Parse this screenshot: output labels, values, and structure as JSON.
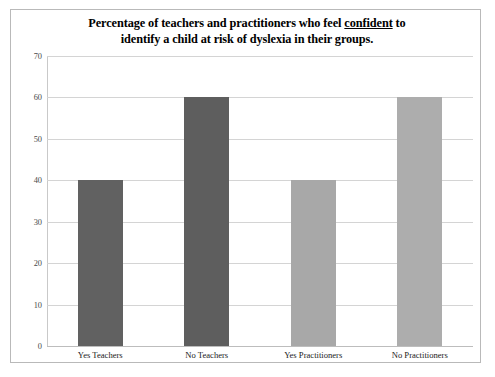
{
  "chart_data": {
    "type": "bar",
    "title_line1_pre": "Percentage of teachers and practitioners who feel ",
    "title_line1_underlined": "confident",
    "title_line1_post": " to",
    "title_line2": "identify a child at risk of dyslexia in their groups.",
    "title": "Percentage of teachers and practitioners who feel confident to identify a child at risk of dyslexia in their groups.",
    "categories": [
      "Yes Teachers",
      "No Teachers",
      "Yes Practitioners",
      "No Practitioners"
    ],
    "values": [
      40,
      60,
      40,
      60
    ],
    "bar_colors": [
      "#616161",
      "#5e5e5e",
      "#a8a8a8",
      "#adadad"
    ],
    "xlabel": "",
    "ylabel": "",
    "ylim": [
      0,
      70
    ],
    "ytick_values": [
      70,
      60,
      50,
      40,
      30,
      20,
      10,
      0
    ],
    "ytick_labels": [
      "70",
      "60",
      "50",
      "40",
      "30",
      "20",
      "10",
      "0"
    ],
    "grid": true,
    "grid_color": "#d4d4d4",
    "legend": false,
    "legend_position": "none",
    "plot_background": "#ffffff",
    "frame_border_color": "#b9b9b9"
  }
}
